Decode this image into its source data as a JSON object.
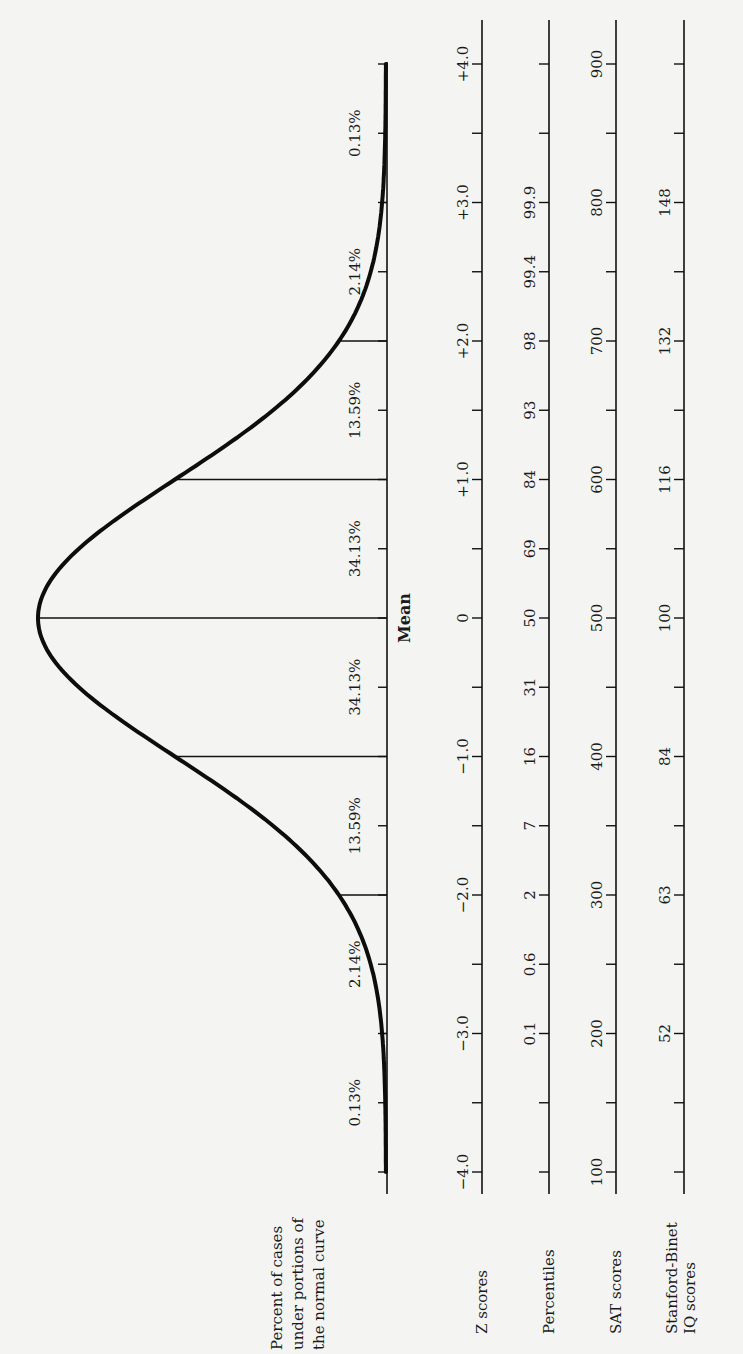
{
  "figure": {
    "curve_label": [
      "Percent of cases",
      "under portions of",
      "the normal curve"
    ],
    "mean_label": "Mean",
    "rows": [
      {
        "key": "z",
        "label": [
          "Z scores"
        ]
      },
      {
        "key": "percentiles",
        "label": [
          "Percentiles"
        ]
      },
      {
        "key": "sat",
        "label": [
          "SAT scores"
        ]
      },
      {
        "key": "iq",
        "label": [
          "Stanford-Binet",
          "IQ scores"
        ]
      }
    ]
  },
  "chart_data": {
    "type": "line",
    "orientation": "rotated 90° counter-clockwise (page in landscape)",
    "curve": "standard normal density, mean 0, SD 1, from -4 to +4",
    "sd_divider_lines_at_z": [
      -3,
      -2,
      -1,
      0,
      1,
      2,
      3
    ],
    "percent_of_cases": [
      {
        "from": -4,
        "to": -3,
        "label": "0.13%"
      },
      {
        "from": -3,
        "to": -2,
        "label": "2.14%"
      },
      {
        "from": -2,
        "to": -1,
        "label": "13.59%"
      },
      {
        "from": -1,
        "to": 0,
        "label": "34.13%"
      },
      {
        "from": 0,
        "to": 1,
        "label": "34.13%"
      },
      {
        "from": 1,
        "to": 2,
        "label": "13.59%"
      },
      {
        "from": 2,
        "to": 3,
        "label": "2.14%"
      },
      {
        "from": 3,
        "to": 4,
        "label": "0.13%"
      }
    ],
    "tick_z_positions": [
      -4,
      -3.5,
      -3,
      -2.5,
      -2,
      -1.5,
      -1,
      -0.5,
      0,
      0.5,
      1,
      1.5,
      2,
      2.5,
      3,
      3.5,
      4
    ],
    "scales": {
      "z_scores": {
        "label": "Z scores",
        "ticks": [
          {
            "z": -4,
            "text": "−4.0"
          },
          {
            "z": -3,
            "text": "−3.0"
          },
          {
            "z": -2,
            "text": "−2.0"
          },
          {
            "z": -1,
            "text": "−1.0"
          },
          {
            "z": 0,
            "text": "0"
          },
          {
            "z": 1,
            "text": "+1.0"
          },
          {
            "z": 2,
            "text": "+2.0"
          },
          {
            "z": 3,
            "text": "+3.0"
          },
          {
            "z": 4,
            "text": "+4.0"
          }
        ]
      },
      "percentiles": {
        "label": "Percentiles",
        "ticks": [
          {
            "z": -3,
            "text": "0.1"
          },
          {
            "z": -2.5,
            "text": "0.6"
          },
          {
            "z": -2,
            "text": "2"
          },
          {
            "z": -1.5,
            "text": "7"
          },
          {
            "z": -1,
            "text": "16"
          },
          {
            "z": -0.5,
            "text": "31"
          },
          {
            "z": 0,
            "text": "50"
          },
          {
            "z": 0.5,
            "text": "69"
          },
          {
            "z": 1,
            "text": "84"
          },
          {
            "z": 1.5,
            "text": "93"
          },
          {
            "z": 2,
            "text": "98"
          },
          {
            "z": 2.5,
            "text": "99.4"
          },
          {
            "z": 3,
            "text": "99.9"
          }
        ]
      },
      "sat_scores": {
        "label": "SAT scores",
        "ticks": [
          {
            "z": -4,
            "text": "100"
          },
          {
            "z": -3,
            "text": "200"
          },
          {
            "z": -2,
            "text": "300"
          },
          {
            "z": -1,
            "text": "400"
          },
          {
            "z": 0,
            "text": "500"
          },
          {
            "z": 1,
            "text": "600"
          },
          {
            "z": 2,
            "text": "700"
          },
          {
            "z": 3,
            "text": "800"
          },
          {
            "z": 4,
            "text": "900"
          }
        ]
      },
      "stanford_binet_iq": {
        "label": "Stanford-Binet IQ scores",
        "ticks": [
          {
            "z": -3,
            "text": "52"
          },
          {
            "z": -2,
            "text": "63"
          },
          {
            "z": -1,
            "text": "84"
          },
          {
            "z": 0,
            "text": "100"
          },
          {
            "z": 1,
            "text": "116"
          },
          {
            "z": 2,
            "text": "132"
          },
          {
            "z": 3,
            "text": "148"
          }
        ]
      }
    },
    "annotations": [
      "Mean"
    ]
  }
}
